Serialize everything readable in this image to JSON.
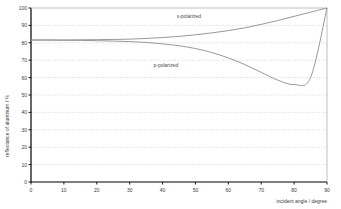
{
  "chart_data": {
    "type": "line",
    "title": "",
    "subtitle": "",
    "xlabel": "incident angle / degree",
    "ylabel": "reflectance of aluminum / %",
    "xlim": [
      0,
      90
    ],
    "ylim": [
      0,
      100
    ],
    "xticks": [
      "0",
      "10",
      "20",
      "30",
      "40",
      "50",
      "60",
      "70",
      "80",
      "90"
    ],
    "xtick_values": [
      0,
      10,
      20,
      30,
      40,
      50,
      60,
      70,
      80,
      90
    ],
    "yticks": [
      "0",
      "10",
      "20",
      "30",
      "40",
      "50",
      "60",
      "70",
      "80",
      "90",
      "100"
    ],
    "ytick_values": [
      0,
      10,
      20,
      30,
      40,
      50,
      60,
      70,
      80,
      90,
      100
    ],
    "grid": "horizontal-dotted",
    "legend_position": "inline-annotations",
    "x": [
      0,
      5,
      10,
      15,
      20,
      25,
      30,
      35,
      40,
      45,
      50,
      55,
      60,
      65,
      70,
      75,
      80,
      85,
      90
    ],
    "series": [
      {
        "name": "s-polarized",
        "label": "s-polarized",
        "color": "#8c8c8c",
        "values": [
          81.6,
          81.6,
          81.6,
          81.7,
          81.8,
          81.9,
          82.1,
          82.5,
          83.0,
          83.7,
          84.6,
          85.7,
          87.0,
          88.6,
          90.6,
          92.8,
          95.2,
          97.6,
          100.0
        ],
        "annotation": {
          "text": "s-polarized",
          "x": 48,
          "y": 94.5
        }
      },
      {
        "name": "p-polarized",
        "label": "p-polarized",
        "color": "#8c8c8c",
        "values": [
          81.6,
          81.6,
          81.5,
          81.4,
          81.2,
          81.0,
          80.7,
          80.2,
          79.4,
          78.3,
          76.7,
          74.4,
          71.3,
          67.5,
          63.0,
          58.6,
          56.0,
          60.0,
          100.0
        ],
        "annotation": {
          "text": "p-polarized",
          "x": 41,
          "y": 66.0
        }
      }
    ],
    "axis_colors": {
      "frame": "#000000",
      "grid": "#c8c8c8",
      "curve": "#8c8c8c",
      "text": "#3a3a3a"
    }
  }
}
